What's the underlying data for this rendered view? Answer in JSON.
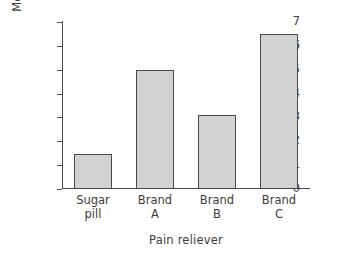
{
  "chart_data": {
    "type": "bar",
    "title": "",
    "xlabel": "Pain reliever",
    "ylabel": "Mean pain tolerance",
    "categories": [
      "Sugar\npill",
      "Brand\nA",
      "Brand\nB",
      "Brand\nC"
    ],
    "values": [
      1.45,
      5.0,
      3.1,
      6.5
    ],
    "ylim": [
      0,
      7
    ],
    "yticks": [
      0,
      1,
      2,
      3,
      4,
      5,
      6,
      7
    ],
    "ytick_labels": [
      "0",
      "1",
      "2",
      "3",
      "4",
      "5",
      "6",
      "7"
    ],
    "grid": false,
    "legend": null,
    "bar_color": "#d2d2d2",
    "bar_edge_color": "#4a4a4a",
    "axis_color": "#4a4a4a"
  }
}
